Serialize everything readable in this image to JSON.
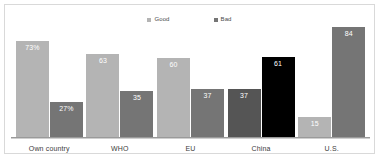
{
  "chart_data": {
    "type": "bar",
    "title": "",
    "subtitle": "",
    "xlabel": "",
    "ylabel": "",
    "ylim": [
      0,
      100
    ],
    "grid": false,
    "legend_position": "top-center",
    "categories": [
      "Own country",
      "WHO",
      "EU",
      "China",
      "U.S."
    ],
    "series": [
      {
        "name": "Good",
        "color": "#b4b4b4",
        "values": [
          73,
          63,
          60,
          37,
          15
        ],
        "value_labels": [
          "73%",
          "63",
          "60",
          "37",
          "15"
        ]
      },
      {
        "name": "Bad",
        "color": "#757575",
        "values": [
          27,
          35,
          37,
          61,
          84
        ],
        "value_labels": [
          "27%",
          "35",
          "37",
          "61",
          "84"
        ]
      }
    ],
    "highlighted_category": "China",
    "highlight_colors": {
      "good": "#555555",
      "bad": "#000000"
    },
    "annotations": []
  },
  "legend": {
    "items": [
      {
        "label": "Good",
        "color": "#b4b4b4"
      },
      {
        "label": "Bad",
        "color": "#757575"
      }
    ]
  },
  "axis": {
    "baseline_color": "#9a9a9a"
  }
}
